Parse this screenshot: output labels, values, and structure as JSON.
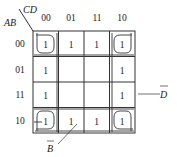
{
  "diagram": {
    "type": "karnaugh-map",
    "row_variable_label": "AB",
    "col_variable_label": "CD",
    "col_headers": [
      "00",
      "01",
      "11",
      "10"
    ],
    "row_headers": [
      "00",
      "01",
      "11",
      "10"
    ],
    "cells": [
      [
        "1",
        "1",
        "1",
        "1"
      ],
      [
        "1",
        "",
        "",
        "1"
      ],
      [
        "1",
        "",
        "",
        "1"
      ],
      [
        "1",
        "1",
        "1",
        "1"
      ]
    ],
    "annotations": {
      "d_bar": {
        "text": "D",
        "overline": true
      },
      "b_bar": {
        "text": "B",
        "overline": true
      }
    },
    "groups": [
      {
        "name": "corners",
        "cells": [
          [
            0,
            0
          ],
          [
            0,
            3
          ],
          [
            3,
            0
          ],
          [
            3,
            3
          ]
        ]
      },
      {
        "name": "column-00",
        "cells": [
          [
            0,
            0
          ],
          [
            1,
            0
          ],
          [
            2,
            0
          ],
          [
            3,
            0
          ]
        ]
      },
      {
        "name": "column-10",
        "cells": [
          [
            0,
            3
          ],
          [
            1,
            3
          ],
          [
            2,
            3
          ],
          [
            3,
            3
          ]
        ]
      },
      {
        "name": "row-00",
        "cells": [
          [
            0,
            0
          ],
          [
            0,
            1
          ],
          [
            0,
            2
          ],
          [
            0,
            3
          ]
        ]
      },
      {
        "name": "row-10",
        "cells": [
          [
            3,
            0
          ],
          [
            3,
            1
          ],
          [
            3,
            2
          ],
          [
            3,
            3
          ]
        ]
      }
    ]
  }
}
